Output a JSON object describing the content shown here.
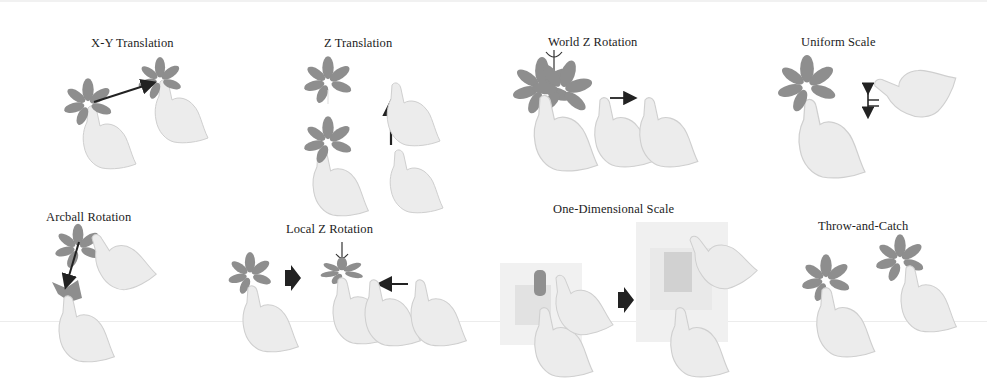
{
  "figure": {
    "panels": [
      {
        "id": "xy-translation",
        "label": "X-Y Translation"
      },
      {
        "id": "z-translation",
        "label": "Z Translation"
      },
      {
        "id": "world-z-rotation",
        "label": "World Z Rotation"
      },
      {
        "id": "uniform-scale",
        "label": "Uniform Scale"
      },
      {
        "id": "arcball-rotation",
        "label": "Arcball Rotation"
      },
      {
        "id": "local-z-rotation",
        "label": "Local Z Rotation"
      },
      {
        "id": "one-dimensional-scale",
        "label": "One-Dimensional Scale"
      },
      {
        "id": "throw-and-catch",
        "label": "Throw-and-Catch"
      }
    ],
    "colors": {
      "flower": "#8e8e8e",
      "hand_fill": "#ececec",
      "hand_stroke": "#cfcfcf",
      "arrow": "#222222"
    }
  }
}
